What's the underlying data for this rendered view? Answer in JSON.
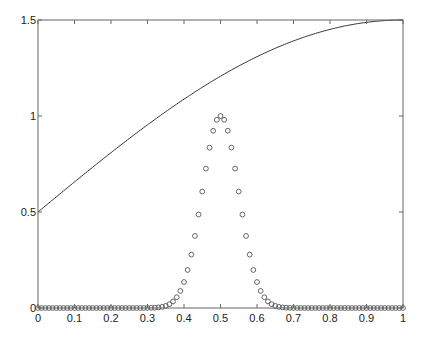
{
  "chart_data": {
    "type": "line",
    "title": "",
    "xlabel": "",
    "ylabel": "",
    "xlim": [
      0,
      1
    ],
    "ylim": [
      0,
      1.5
    ],
    "grid": false,
    "legend": null,
    "x_ticks": [
      "0",
      "0.1",
      "0.2",
      "0.3",
      "0.4",
      "0.5",
      "0.6",
      "0.7",
      "0.8",
      "0.9",
      "1"
    ],
    "y_ticks": [
      "0",
      "0.5",
      "1",
      "1.5"
    ],
    "series": [
      {
        "name": "curve",
        "style": "solid-line",
        "formula": "0.5 + sin(pi*x/2)",
        "x": [
          0,
          0.1,
          0.2,
          0.3,
          0.4,
          0.5,
          0.6,
          0.7,
          0.8,
          0.9,
          1.0
        ],
        "values": [
          0.5,
          0.656,
          0.809,
          0.954,
          1.088,
          1.207,
          1.309,
          1.391,
          1.451,
          1.488,
          1.5
        ]
      },
      {
        "name": "gaussian-markers",
        "style": "open-circles",
        "formula": "exp(-200*(x-0.5)^2)",
        "x_start": 0,
        "x_end": 1,
        "x_step": 0.01,
        "x": [
          0.35,
          0.36,
          0.37,
          0.38,
          0.39,
          0.4,
          0.41,
          0.42,
          0.43,
          0.44,
          0.45,
          0.46,
          0.47,
          0.48,
          0.49,
          0.5,
          0.51,
          0.52,
          0.53,
          0.54,
          0.55,
          0.56,
          0.57,
          0.58,
          0.59,
          0.6,
          0.61,
          0.62,
          0.63,
          0.64,
          0.65
        ],
        "values": [
          0.011,
          0.02,
          0.034,
          0.056,
          0.089,
          0.135,
          0.198,
          0.278,
          0.375,
          0.487,
          0.607,
          0.726,
          0.835,
          0.923,
          0.98,
          1.0,
          0.98,
          0.923,
          0.835,
          0.726,
          0.607,
          0.487,
          0.375,
          0.278,
          0.198,
          0.135,
          0.089,
          0.056,
          0.034,
          0.02,
          0.011
        ],
        "note": "values outside 0.35–0.65 are ~0"
      }
    ],
    "colors": {
      "axes": "#555555",
      "line": "#333333",
      "markers": "#555555"
    }
  }
}
